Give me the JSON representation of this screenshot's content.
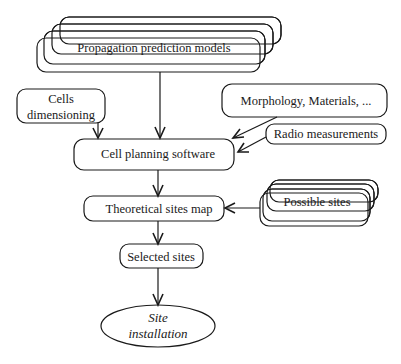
{
  "diagram": {
    "nodes": {
      "propagation": {
        "label": "Propagation prediction models",
        "stacked": true
      },
      "cells_dimensioning": {
        "line1": "Cells",
        "line2": "dimensioning"
      },
      "morphology": {
        "label": "Morphology, Materials, ..."
      },
      "radio_measurements": {
        "label": "Radio measurements"
      },
      "cell_planning": {
        "label": "Cell planning software"
      },
      "theoretical_map": {
        "label": "Theoretical sites map"
      },
      "possible_sites": {
        "label": "Possible sites",
        "stacked": true
      },
      "selected_sites": {
        "label": "Selected sites"
      },
      "site_installation": {
        "line1": "Site",
        "line2": "installation",
        "shape": "ellipse"
      }
    },
    "edges": [
      {
        "from": "propagation",
        "to": "cell_planning"
      },
      {
        "from": "cells_dimensioning",
        "to": "cell_planning"
      },
      {
        "from": "morphology",
        "to": "cell_planning"
      },
      {
        "from": "radio_measurements",
        "to": "cell_planning"
      },
      {
        "from": "cell_planning",
        "to": "theoretical_map"
      },
      {
        "from": "possible_sites",
        "to": "theoretical_map"
      },
      {
        "from": "theoretical_map",
        "to": "selected_sites"
      },
      {
        "from": "selected_sites",
        "to": "site_installation"
      }
    ]
  }
}
